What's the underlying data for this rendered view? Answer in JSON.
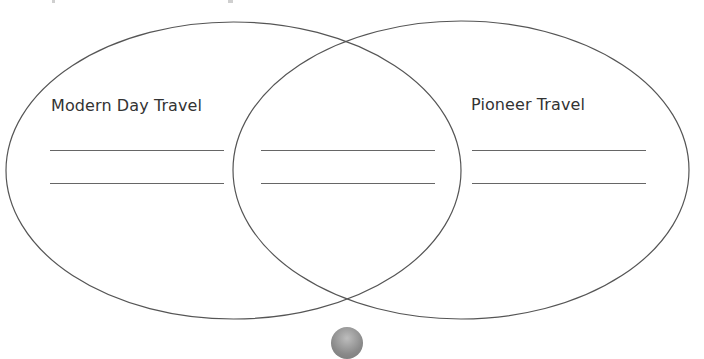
{
  "diagram": {
    "type": "venn",
    "sets": [
      {
        "id": "left",
        "label": "Modern Day Travel",
        "ellipse": {
          "cx": 233.5,
          "cy": 170.5,
          "rx": 227.5,
          "ry": 148.5
        },
        "answer_lines": 2
      },
      {
        "id": "overlap",
        "label": "",
        "answer_lines": 2
      },
      {
        "id": "right",
        "label": "Pioneer Travel",
        "ellipse": {
          "cx": 461,
          "cy": 170,
          "rx": 228,
          "ry": 149
        },
        "answer_lines": 2
      }
    ],
    "stroke_color": "#555555",
    "line_color": "#666666",
    "text_color": "#333333",
    "badge_color": "#8a8a8a"
  }
}
